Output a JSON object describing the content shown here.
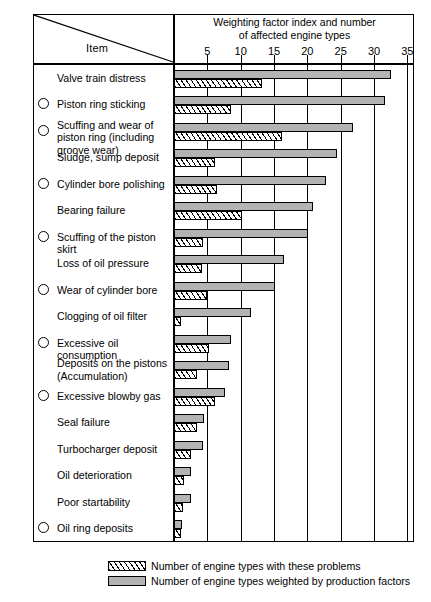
{
  "table": {
    "item_header": "Item",
    "axis_title_line1": "Weighting factor index and number",
    "axis_title_line2": "of affected engine types"
  },
  "legend": {
    "hatch_label": "Number of engine types with these problems",
    "gray_label": "Number of engine types weighted by production factors"
  },
  "colors": {
    "gray_bar": "#b3b3b3",
    "outline": "#000000",
    "background": "#ffffff"
  },
  "chart_data": {
    "type": "bar",
    "orientation": "horizontal",
    "title": "Weighting factor index and number of affected engine types",
    "xlabel": "Weighting factor index and number of affected engine types",
    "ylabel": "Item",
    "xlim": [
      0,
      36
    ],
    "xticks": [
      5,
      10,
      15,
      20,
      25,
      30,
      35
    ],
    "grid": true,
    "legend_position": "bottom",
    "categories": [
      "Valve train distress",
      "Piston ring sticking",
      "Scuffing and wear of piston ring (including groove wear)",
      "Sludge, sump deposit",
      "Cylinder bore polishing",
      "Bearing failure",
      "Scuffing of the piston skirt",
      "Loss of oil pressure",
      "Wear of cylinder bore",
      "Clogging of oil filter",
      "Excessive oil consumption",
      "Deposits on the pistons (Accumulation)",
      "Excessive blowby gas",
      "Seal failure",
      "Turbocharger deposit",
      "Oil deterioration",
      "Poor startability",
      "Oil ring deposits"
    ],
    "marked_categories": [
      "Piston ring sticking",
      "Scuffing and wear of piston ring (including groove wear)",
      "Cylinder bore polishing",
      "Scuffing of the piston skirt",
      "Wear of cylinder bore",
      "Excessive oil consumption",
      "Excessive blowby gas",
      "Oil ring deposits"
    ],
    "series": [
      {
        "name": "Number of engine types weighted by production factors",
        "style": "gray",
        "values": [
          32.5,
          31.7,
          26.8,
          24.5,
          22.8,
          20.9,
          20.1,
          16.5,
          15.2,
          11.5,
          8.6,
          8.3,
          7.7,
          4.5,
          4.4,
          2.6,
          2.6,
          1.2
        ]
      },
      {
        "name": "Number of engine types with these problems",
        "style": "hatch",
        "values": [
          13.2,
          8.6,
          16.2,
          6.1,
          6.4,
          10.2,
          4.4,
          4.2,
          5.0,
          1.1,
          5.2,
          3.5,
          6.2,
          3.4,
          2.5,
          1.5,
          1.4,
          1.1
        ]
      }
    ]
  },
  "rows": [
    {
      "label": "Valve train distress",
      "marked": false,
      "lines": 1,
      "gray": 32.5,
      "hatch": 13.2
    },
    {
      "label": "Piston ring sticking",
      "marked": true,
      "lines": 1,
      "gray": 31.7,
      "hatch": 8.6
    },
    {
      "label": "Scuffing and wear of piston ring (including groove wear)",
      "marked": true,
      "lines": 2,
      "gray": 26.8,
      "hatch": 16.2
    },
    {
      "label": "Sludge, sump deposit",
      "marked": false,
      "lines": 1,
      "gray": 24.5,
      "hatch": 6.1
    },
    {
      "label": "Cylinder bore polishing",
      "marked": true,
      "lines": 1,
      "gray": 22.8,
      "hatch": 6.4
    },
    {
      "label": "Bearing failure",
      "marked": false,
      "lines": 1,
      "gray": 20.9,
      "hatch": 10.2
    },
    {
      "label": "Scuffing of the piston skirt",
      "marked": true,
      "lines": 1,
      "gray": 20.1,
      "hatch": 4.4
    },
    {
      "label": "Loss of oil pressure",
      "marked": false,
      "lines": 1,
      "gray": 16.5,
      "hatch": 4.2
    },
    {
      "label": "Wear of cylinder bore",
      "marked": true,
      "lines": 1,
      "gray": 15.2,
      "hatch": 5.0
    },
    {
      "label": "Clogging of oil filter",
      "marked": false,
      "lines": 1,
      "gray": 11.5,
      "hatch": 1.1
    },
    {
      "label": "Excessive oil consumption",
      "marked": true,
      "lines": 1,
      "gray": 8.6,
      "hatch": 5.2
    },
    {
      "label": "Deposits on the pistons (Accumulation)",
      "marked": false,
      "lines": 2,
      "gray": 8.3,
      "hatch": 3.5
    },
    {
      "label": "Excessive blowby gas",
      "marked": true,
      "lines": 1,
      "gray": 7.7,
      "hatch": 6.2
    },
    {
      "label": "Seal failure",
      "marked": false,
      "lines": 1,
      "gray": 4.5,
      "hatch": 3.4
    },
    {
      "label": "Turbocharger deposit",
      "marked": false,
      "lines": 1,
      "gray": 4.4,
      "hatch": 2.5
    },
    {
      "label": "Oil deterioration",
      "marked": false,
      "lines": 1,
      "gray": 2.6,
      "hatch": 1.5
    },
    {
      "label": "Poor startability",
      "marked": false,
      "lines": 1,
      "gray": 2.6,
      "hatch": 1.4
    },
    {
      "label": "Oil ring deposits",
      "marked": true,
      "lines": 1,
      "gray": 1.2,
      "hatch": 1.1
    }
  ]
}
